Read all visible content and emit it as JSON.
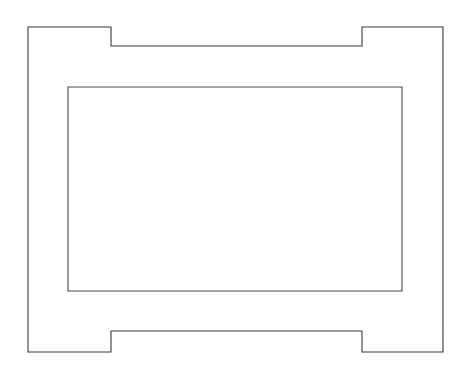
{
  "canvas": {
    "width": 467,
    "height": 373,
    "background_color": "#ffffff",
    "description": "line-drawing"
  },
  "drawing": {
    "title": "",
    "stroke_color": "#3b3b3b",
    "inner_stroke_color": "#4a4a4a",
    "fill_color": "#ffffff",
    "stroke_width": 1.1,
    "outer_shape": {
      "name": "notched-rectangle-frame",
      "bounds": {
        "left": 28,
        "top": 27,
        "right": 443,
        "bottom": 352
      },
      "top_notch": {
        "x_start": 111,
        "x_end": 362,
        "y_inset": 46,
        "depth": 19
      },
      "bottom_notch": {
        "x_start": 111,
        "x_end": 362,
        "y_inset": 331,
        "depth": 21
      },
      "points": "28,27 111,27 111,46 362,46 362,27 443,27 443,352 362,352 362,331 111,331 111,352 28,352"
    },
    "inner_shape": {
      "name": "inner-rectangle",
      "bounds": {
        "left": 68,
        "top": 87,
        "right": 402,
        "bottom": 291
      },
      "width": 334,
      "height": 204,
      "points": "68,87 402,87 402,291 68,291"
    }
  }
}
